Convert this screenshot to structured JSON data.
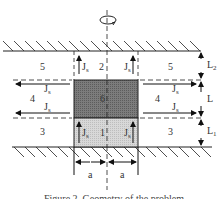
{
  "figure": {
    "caption": "Figure 2. Geometry of the problem",
    "rotation_symbol": "rotation-arrow",
    "regions": [
      {
        "id": "1",
        "label": "1"
      },
      {
        "id": "2",
        "label": "2"
      },
      {
        "id": "3",
        "label": "3"
      },
      {
        "id": "4",
        "label": "4"
      },
      {
        "id": "5",
        "label": "5"
      },
      {
        "id": "6",
        "label": "6"
      }
    ],
    "region_labels": {
      "r1": "1",
      "r2": "2",
      "r3_left": "3",
      "r3_right": "3",
      "r4_left": "4",
      "r4_right": "4",
      "r5_left": "5",
      "r5_right": "5",
      "r6": "6"
    },
    "current_label": "J",
    "current_sub": "s",
    "dimensions": {
      "L2": {
        "main": "L",
        "sub": "2"
      },
      "L": {
        "main": "L",
        "sub": ""
      },
      "L1": {
        "main": "L",
        "sub": "1"
      },
      "a_left": "a",
      "a_right": "a"
    },
    "colors": {
      "dark_block": "#7a7a7a",
      "light_block": "#d4d4d4",
      "line": "#222222"
    }
  }
}
